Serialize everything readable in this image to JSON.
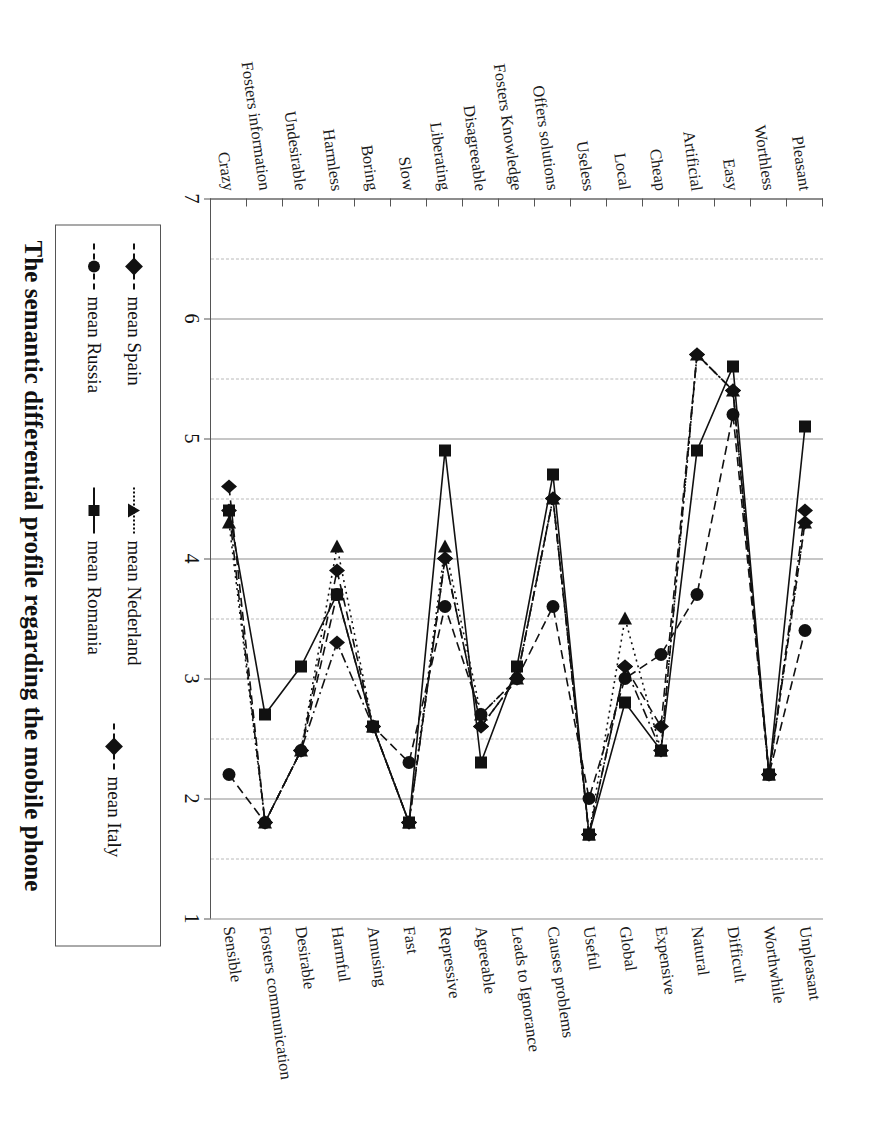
{
  "figure": {
    "title": "The semantic differential profile regarding the mobile phone",
    "orientation": "rotated-90"
  },
  "axis": {
    "tick_labels": [
      "7",
      "6",
      "5",
      "4",
      "3",
      "2",
      "1"
    ],
    "min": 1,
    "max": 7
  },
  "legend": {
    "entries": [
      {
        "label": "mean Spain",
        "marker": "diamond-marker",
        "dash": "dashed"
      },
      {
        "label": "mean Russia",
        "marker": "circle-marker",
        "dash": "dashed"
      },
      {
        "label": "mean Nederland",
        "marker": "triangle-marker",
        "dash": "dotted"
      },
      {
        "label": "mean Romania",
        "marker": "square-marker",
        "dash": "solid"
      },
      {
        "label": "mean Italy",
        "marker": "diamond-marker",
        "dash": "dash-dot"
      }
    ]
  },
  "chart_data": {
    "type": "line",
    "title": "The semantic differential profile regarding the mobile phone",
    "xlabel": "",
    "ylabel": "",
    "xlim": [
      1,
      7
    ],
    "grid": true,
    "legend_position": "bottom",
    "axis_ticks": [
      7,
      6,
      5,
      4,
      3,
      2,
      1
    ],
    "categories_left": [
      "Crazy",
      "Fosters information",
      "Undesirable",
      "Harmless",
      "Boring",
      "Slow",
      "Liberating",
      "Disagreeable",
      "Fosters Knowledge",
      "Offers solutions",
      "Useless",
      "Local",
      "Cheap",
      "Artificial",
      "Easy",
      "Worthless",
      "Pleasant"
    ],
    "categories_right": [
      "Sensible",
      "Fosters communication",
      "Desirable",
      "Harmful",
      "Amusing",
      "Fast",
      "Repressive",
      "Agreeable",
      "Leads to Ignorance",
      "Causes problems",
      "Useful",
      "Global",
      "Expensive",
      "Natural",
      "Difficult",
      "Worthwhile",
      "Unpleasant"
    ],
    "series": [
      {
        "name": "mean Spain",
        "marker": "diamond-marker",
        "dash": "dashed",
        "values": [
          4.6,
          1.8,
          2.4,
          3.9,
          2.6,
          1.8,
          4.0,
          2.6,
          3.0,
          4.5,
          1.7,
          3.1,
          2.6,
          5.7,
          5.4,
          2.2,
          4.3
        ]
      },
      {
        "name": "mean Russia",
        "marker": "circle-marker",
        "dash": "dashed",
        "values": [
          2.2,
          1.8,
          2.4,
          3.7,
          2.6,
          2.3,
          3.6,
          2.7,
          3.0,
          3.6,
          2.0,
          3.0,
          3.2,
          3.7,
          5.2,
          2.2,
          3.4
        ]
      },
      {
        "name": "mean Nederland",
        "marker": "triangle-marker",
        "dash": "dotted",
        "values": [
          4.3,
          1.8,
          2.4,
          4.1,
          2.6,
          1.8,
          4.1,
          2.7,
          3.0,
          4.5,
          1.7,
          3.5,
          2.4,
          5.7,
          5.4,
          2.2,
          4.3
        ]
      },
      {
        "name": "mean Romania",
        "marker": "square-marker",
        "dash": "solid",
        "values": [
          4.4,
          2.7,
          3.1,
          3.7,
          2.6,
          1.8,
          4.9,
          2.3,
          3.1,
          4.7,
          1.7,
          2.8,
          2.4,
          4.9,
          5.6,
          2.2,
          5.1
        ]
      },
      {
        "name": "mean Italy",
        "marker": "diamond-marker",
        "dash": "dash-dot",
        "values": [
          4.4,
          1.8,
          2.4,
          3.3,
          2.6,
          1.8,
          4.0,
          2.6,
          3.0,
          4.5,
          1.7,
          3.1,
          2.4,
          5.7,
          5.4,
          2.2,
          4.4
        ]
      }
    ]
  }
}
